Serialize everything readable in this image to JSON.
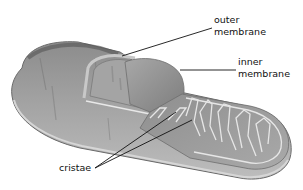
{
  "diagram": {
    "labels": {
      "outer_membrane": [
        "outer",
        "membrane"
      ],
      "inner_membrane": [
        "inner",
        "membrane"
      ],
      "cristae": "cristae"
    },
    "colors": {
      "body_dark": "#6e6e6e",
      "body_mid": "#9a9a9a",
      "body_light": "#c4c4c4",
      "membrane_highlight": "#e6e6e6",
      "leader_line": "#111111",
      "background": "#ffffff"
    }
  }
}
